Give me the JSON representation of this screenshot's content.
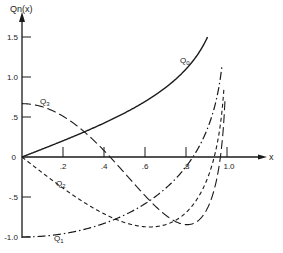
{
  "chart_data": {
    "type": "line",
    "title": "",
    "xlabel": "x",
    "ylabel": "Q_n(x)",
    "xlim": [
      0,
      1.0
    ],
    "ylim": [
      -1.0,
      1.5
    ],
    "x_ticks": [
      ".2",
      ".4",
      ".6",
      ".8",
      "1.0"
    ],
    "y_ticks": [
      "1.5",
      "1.0",
      ".5",
      "0",
      "-.5",
      "-1.0"
    ],
    "grid": false,
    "legend": "inline labels",
    "series": [
      {
        "name": "Q0",
        "label": "Q₀",
        "style": "solid",
        "x": [
          0,
          0.2,
          0.4,
          0.6,
          0.8,
          0.9
        ],
        "values": [
          0,
          0.203,
          0.424,
          0.693,
          1.099,
          1.472
        ]
      },
      {
        "name": "Q1",
        "label": "Q₁",
        "style": "dash-dot",
        "x": [
          0,
          0.2,
          0.4,
          0.6,
          0.8,
          0.9,
          0.95,
          0.97
        ],
        "values": [
          -1.0,
          -0.959,
          -0.83,
          -0.584,
          -0.121,
          0.325,
          0.738,
          1.03
        ]
      },
      {
        "name": "Q2",
        "label": "Q₂",
        "style": "short-dash",
        "x": [
          0,
          0.2,
          0.4,
          0.6,
          0.8,
          0.9,
          0.95,
          0.98
        ],
        "values": [
          0,
          -0.396,
          -0.684,
          -0.841,
          -0.646,
          -0.134,
          0.505,
          1.3
        ]
      },
      {
        "name": "Q3",
        "label": "Q₃",
        "style": "long-dash",
        "x": [
          0,
          0.2,
          0.4,
          0.6,
          0.8,
          0.9,
          0.95,
          0.99
        ],
        "values": [
          0.667,
          0.568,
          0.285,
          -0.135,
          -0.604,
          -0.753,
          -0.47,
          1.1
        ]
      }
    ]
  },
  "labels": {
    "y_axis": "Qn(x)",
    "x_axis": "x",
    "origin": "0",
    "q0": "Q0",
    "q1": "Q1",
    "q2": "Q2",
    "q3": "Q3"
  }
}
